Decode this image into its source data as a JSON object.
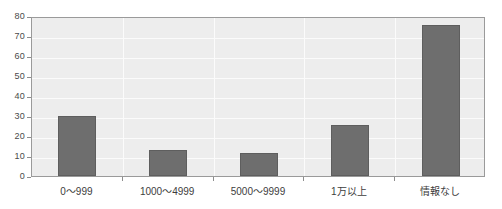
{
  "chart_data": {
    "type": "bar",
    "title": "",
    "subtitle": "",
    "xlabel": "",
    "ylabel": "",
    "categories": [
      "0～999",
      "1000～4999",
      "5000～9999",
      "1万以上",
      "情報なし"
    ],
    "values": [
      30,
      13,
      11.5,
      25.5,
      75.5
    ],
    "ylim": [
      0,
      80
    ],
    "yticks": [
      0,
      10,
      20,
      30,
      40,
      50,
      60,
      70,
      80
    ],
    "ytick_labels": [
      "0",
      "10",
      "20",
      "30",
      "40",
      "50",
      "60",
      "70",
      "80"
    ],
    "grid": true,
    "legend": false,
    "legend_position": "none",
    "bar_color": "#6e6e6e",
    "plot_background": "#ededed",
    "gridline_color": "#fbfbfb",
    "frame_color": "#9a9a9a",
    "axis_label_color": "#4a4a4a"
  }
}
